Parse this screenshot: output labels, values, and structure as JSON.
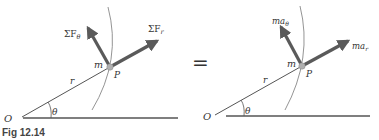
{
  "figure": {
    "caption": "Fig 12.14",
    "equals": "="
  },
  "left_panel": {
    "origin_label": "O",
    "angle_label": "θ",
    "radius_label": "r",
    "mass_label": "m",
    "point_label": "P",
    "force_theta": {
      "sigma": "ΣF",
      "sub": "θ"
    },
    "force_r": {
      "sigma": "ΣF",
      "sub": "r"
    }
  },
  "right_panel": {
    "origin_label": "O",
    "angle_label": "θ",
    "radius_label": "r",
    "mass_label": "m",
    "point_label": "P",
    "accel_theta": {
      "main": "ma",
      "sub": "θ"
    },
    "accel_r": {
      "main": "ma",
      "sub": "r"
    }
  },
  "colors": {
    "arrow": "#5a5a5a",
    "line": "#555555",
    "arc": "#888888",
    "point": "#b0b0b0"
  }
}
